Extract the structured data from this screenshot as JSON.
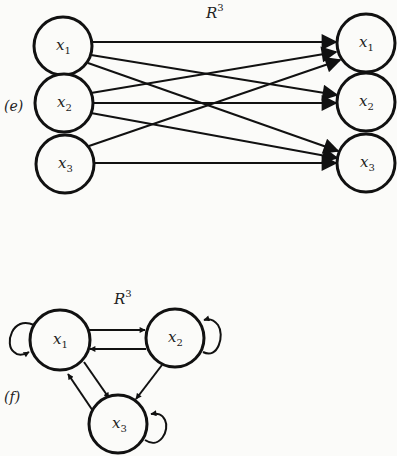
{
  "figure_e": {
    "part_label": "(e)",
    "title": "R",
    "title_sup": "3",
    "left_nodes": [
      {
        "var": "x",
        "sub": "1"
      },
      {
        "var": "x",
        "sub": "2"
      },
      {
        "var": "x",
        "sub": "3"
      }
    ],
    "right_nodes": [
      {
        "var": "x",
        "sub": "1"
      },
      {
        "var": "x",
        "sub": "2"
      },
      {
        "var": "x",
        "sub": "3"
      }
    ],
    "edges": [
      {
        "from": "x1",
        "to": "x1"
      },
      {
        "from": "x1",
        "to": "x2"
      },
      {
        "from": "x1",
        "to": "x3"
      },
      {
        "from": "x2",
        "to": "x1"
      },
      {
        "from": "x2",
        "to": "x2"
      },
      {
        "from": "x2",
        "to": "x3"
      },
      {
        "from": "x3",
        "to": "x1"
      },
      {
        "from": "x3",
        "to": "x3"
      }
    ]
  },
  "figure_f": {
    "part_label": "(f)",
    "title": "R",
    "title_sup": "3",
    "nodes": [
      {
        "var": "x",
        "sub": "1"
      },
      {
        "var": "x",
        "sub": "2"
      },
      {
        "var": "x",
        "sub": "3"
      }
    ],
    "edges": [
      {
        "from": "x1",
        "to": "x1"
      },
      {
        "from": "x1",
        "to": "x2"
      },
      {
        "from": "x2",
        "to": "x1"
      },
      {
        "from": "x2",
        "to": "x2"
      },
      {
        "from": "x1",
        "to": "x3"
      },
      {
        "from": "x3",
        "to": "x1"
      },
      {
        "from": "x2",
        "to": "x3"
      },
      {
        "from": "x3",
        "to": "x3"
      }
    ]
  }
}
